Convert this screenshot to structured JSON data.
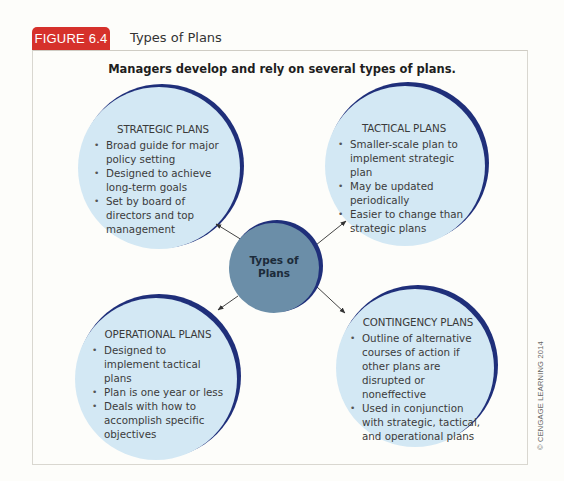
{
  "figure": {
    "label": "FIGURE 6.4",
    "title": "Types of Plans",
    "subtitle": "Managers develop and rely on several types of plans."
  },
  "center": {
    "line1": "Types of",
    "line2": "Plans"
  },
  "plans": {
    "strategic": {
      "heading": "STRATEGIC PLANS",
      "bullets": [
        "Broad guide for major policy setting",
        "Designed to achieve long-term goals",
        "Set by board of directors and top management"
      ]
    },
    "tactical": {
      "heading": "TACTICAL PLANS",
      "bullets": [
        "Smaller-scale plan to implement strategic plan",
        "May be updated periodically",
        "Easier to change than strategic plans"
      ]
    },
    "operational": {
      "heading": "OPERATIONAL PLANS",
      "bullets": [
        "Designed to implement tactical plans",
        "Plan is one year or less",
        "Deals with how to accomplish specific objectives"
      ]
    },
    "contingency": {
      "heading": "CONTINGENCY PLANS",
      "bullets": [
        "Outline of alternative courses of action if other plans are disrupted or noneffective",
        "Used in conjunction with strategic, tactical, and operational plans"
      ]
    }
  },
  "colors": {
    "badge": "#d6312b",
    "circle_fill": "#d3e8f4",
    "circle_rim": "#1f2f7a",
    "center_fill": "#6b8ea8"
  },
  "copyright": "© CENGAGE LEARNING 2014"
}
